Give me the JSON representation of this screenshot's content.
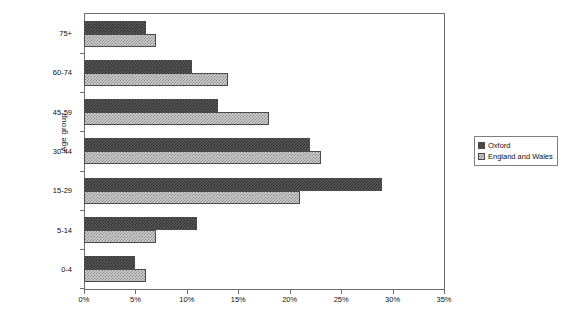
{
  "chart_data": {
    "type": "bar",
    "orientation": "horizontal",
    "title": "",
    "xlabel": "",
    "ylabel": "Age group",
    "categories": [
      "75+",
      "60-74",
      "45-59",
      "30-44",
      "15-29",
      "5-14",
      "0-4"
    ],
    "series": [
      {
        "name": "Oxford",
        "values": [
          6,
          10.5,
          13,
          22,
          29,
          11,
          5
        ]
      },
      {
        "name": "England and Wales",
        "values": [
          7,
          14,
          18,
          23,
          21,
          7,
          6
        ]
      }
    ],
    "xlim": [
      0,
      35
    ],
    "xtick_values": [
      0,
      5,
      10,
      15,
      20,
      25,
      30,
      35
    ],
    "xtick_labels": [
      "0%",
      "5%",
      "10%",
      "15%",
      "20%",
      "25%",
      "30%",
      "35%"
    ],
    "grid": false,
    "legend_position": "right",
    "value_suffix": "%"
  },
  "legend": {
    "entries": [
      {
        "label": "Oxford"
      },
      {
        "label": "England and Wales"
      }
    ]
  },
  "colors": {
    "series_oxford": "#2f2f2f",
    "series_england_wales": "#8e8e8e",
    "axis": "#6d6d6d",
    "text": "#111111",
    "background": "#ffffff"
  }
}
